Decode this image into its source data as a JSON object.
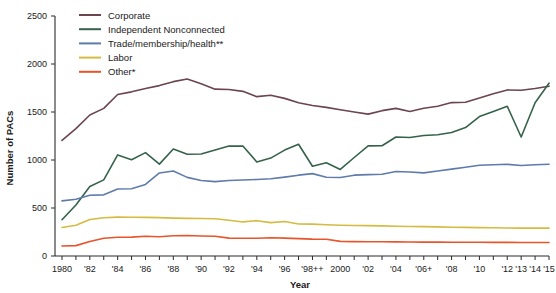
{
  "chart_data": {
    "type": "line",
    "title": "",
    "xlabel": "Year",
    "ylabel": "Number of PACs",
    "ylim": [
      0,
      2500
    ],
    "yticks": [
      0,
      500,
      1000,
      1500,
      2000,
      2500
    ],
    "ytick_labels": [
      "0",
      "500",
      "1000",
      "1500",
      "2000",
      "2500"
    ],
    "grid": false,
    "legend_position": "top-left",
    "x": [
      1980,
      1981,
      1982,
      1983,
      1984,
      1985,
      1986,
      1987,
      1988,
      1989,
      1990,
      1991,
      1992,
      1993,
      1994,
      1995,
      1996,
      1997,
      1998,
      1999,
      2000,
      2001,
      2002,
      2003,
      2004,
      2005,
      2006,
      2007,
      2008,
      2009,
      2010,
      2011,
      2012,
      2013,
      2014,
      2015
    ],
    "xtick_labels": [
      "1980",
      "",
      "'82",
      "",
      "'84",
      "",
      "'86",
      "",
      "'88",
      "",
      "'90",
      "",
      "'92",
      "",
      "'94",
      "",
      "'96",
      "",
      "'98++",
      "",
      "2000",
      "",
      "'02",
      "",
      "'04",
      "",
      "'06+",
      "",
      "'08",
      "",
      "'10",
      "",
      "'12",
      "'13",
      "'14",
      "'15"
    ],
    "series": [
      {
        "name": "Corporate",
        "color": "#6b4550",
        "values": [
          1204,
          1327,
          1469,
          1538,
          1682,
          1710,
          1744,
          1775,
          1816,
          1843,
          1795,
          1738,
          1735,
          1715,
          1660,
          1674,
          1642,
          1597,
          1567,
          1548,
          1523,
          1500,
          1478,
          1514,
          1538,
          1505,
          1539,
          1560,
          1598,
          1601,
          1645,
          1690,
          1730,
          1727,
          1745,
          1769
        ]
      },
      {
        "name": "Independent Nonconnected",
        "color": "#35624a",
        "values": [
          378,
          531,
          723,
          793,
          1053,
          1003,
          1077,
          957,
          1115,
          1060,
          1062,
          1105,
          1145,
          1146,
          980,
          1020,
          1103,
          1164,
          935,
          972,
          902,
          1026,
          1147,
          1149,
          1240,
          1234,
          1255,
          1263,
          1286,
          1338,
          1452,
          1505,
          1560,
          1240,
          1597,
          1800
        ]
      },
      {
        "name": "Trade/membership/health**",
        "color": "#5f7bab",
        "values": [
          574,
          592,
          633,
          637,
          698,
          700,
          745,
          865,
          886,
          819,
          787,
          775,
          787,
          792,
          797,
          804,
          822,
          842,
          858,
          820,
          818,
          842,
          848,
          852,
          880,
          875,
          866,
          885,
          905,
          925,
          946,
          950,
          955,
          942,
          950,
          955
        ]
      },
      {
        "name": "Labor",
        "color": "#d4bb42",
        "values": [
          297,
          320,
          380,
          398,
          405,
          403,
          402,
          400,
          395,
          392,
          390,
          388,
          372,
          355,
          368,
          348,
          360,
          333,
          332,
          325,
          320,
          318,
          316,
          314,
          310,
          308,
          306,
          303,
          300,
          298,
          296,
          294,
          292,
          290,
          290,
          290
        ]
      },
      {
        "name": "Other*",
        "color": "#e8542b",
        "values": [
          104,
          108,
          152,
          185,
          196,
          197,
          205,
          200,
          211,
          213,
          209,
          205,
          186,
          185,
          185,
          190,
          186,
          181,
          176,
          175,
          152,
          150,
          149,
          148,
          147,
          146,
          145,
          145,
          144,
          143,
          143,
          142,
          142,
          141,
          141,
          141
        ]
      }
    ]
  },
  "axes": {
    "y_axis_label": "Number of PACs",
    "x_axis_label": "Year"
  },
  "legend": {
    "items": [
      {
        "label": "Corporate",
        "color": "#6b4550"
      },
      {
        "label": "Independent Nonconnected",
        "color": "#35624a"
      },
      {
        "label": "Trade/membership/health**",
        "color": "#5f7bab"
      },
      {
        "label": "Labor",
        "color": "#d4bb42"
      },
      {
        "label": "Other*",
        "color": "#e8542b"
      }
    ]
  }
}
